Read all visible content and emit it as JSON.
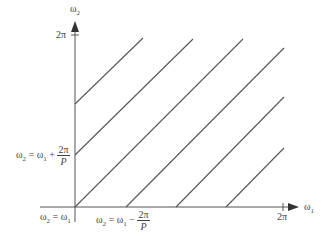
{
  "diagram": {
    "axes": {
      "x_label": "ω₁",
      "y_label": "ω₂",
      "x_max_tick": "2π",
      "y_max_tick": "2π"
    },
    "annotations": {
      "upper_line": {
        "lhs": "ω",
        "lhs_sub": "2",
        "eq": " = ω",
        "rhs_sub": "1",
        "op": " + ",
        "num": "2π",
        "den": "P"
      },
      "diagonal": {
        "lhs": "ω",
        "lhs_sub": "2",
        "eq": " = ω",
        "rhs_sub": "1"
      },
      "lower_line": {
        "lhs": "ω",
        "lhs_sub": "2",
        "eq": " = ω",
        "rhs_sub": "1",
        "op": " − ",
        "num": "2π",
        "den": "P"
      }
    },
    "lines": [
      {
        "x1": 75,
        "y1": 104,
        "x2": 143,
        "y2": 38
      },
      {
        "x1": 75,
        "y1": 155,
        "x2": 193,
        "y2": 39
      },
      {
        "x1": 75,
        "y1": 207,
        "x2": 243,
        "y2": 39
      },
      {
        "x1": 126,
        "y1": 207,
        "x2": 284,
        "y2": 48
      },
      {
        "x1": 176,
        "y1": 207,
        "x2": 284,
        "y2": 97
      },
      {
        "x1": 226,
        "y1": 207,
        "x2": 284,
        "y2": 148
      }
    ],
    "colors": {
      "stroke": "#555555",
      "axis": "#555555",
      "text": "#444444"
    }
  }
}
